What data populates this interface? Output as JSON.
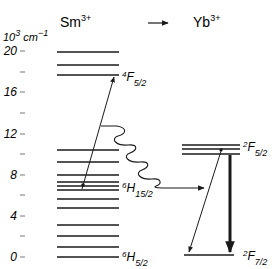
{
  "axis": {
    "unit_base": "10",
    "unit_exp": "3",
    "unit_rest": " cm",
    "unit_exp2": "−1",
    "ticks": [
      {
        "value": 20,
        "label": "20",
        "y": 51
      },
      {
        "value": 18,
        "label": "",
        "y": 72
      },
      {
        "value": 16,
        "label": "16",
        "y": 92
      },
      {
        "value": 14,
        "label": "",
        "y": 113
      },
      {
        "value": 12,
        "label": "12",
        "y": 134
      },
      {
        "value": 10,
        "label": "",
        "y": 154
      },
      {
        "value": 8,
        "label": "8",
        "y": 175
      },
      {
        "value": 6,
        "label": "",
        "y": 195
      },
      {
        "value": 4,
        "label": "4",
        "y": 216
      },
      {
        "value": 2,
        "label": "",
        "y": 236
      },
      {
        "value": 0,
        "label": "0",
        "y": 257
      }
    ]
  },
  "header": {
    "donor_base": "Sm",
    "donor_charge": "3+",
    "transfer_arrow": "→",
    "acceptor_base": "Yb",
    "acceptor_charge": "3+"
  },
  "sm_levels_y": [
    52,
    65,
    75,
    150,
    162,
    175,
    182,
    186,
    190,
    199,
    208,
    225,
    236,
    247,
    257
  ],
  "yb_levels_y": [
    145,
    149,
    154
  ],
  "yb_ground_y": 255,
  "terms": {
    "sm_4F52": {
      "mult": "4",
      "letter": "F",
      "j": "5/2"
    },
    "sm_6H152": {
      "mult": "6",
      "letter": "H",
      "j": "15/2"
    },
    "sm_6H52": {
      "mult": "6",
      "letter": "H",
      "j": "5/2"
    },
    "yb_2F52": {
      "mult": "2",
      "letter": "F",
      "j": "5/2"
    },
    "yb_2F72": {
      "mult": "2",
      "letter": "F",
      "j": "7/2"
    }
  },
  "chart_data": {
    "type": "energy-level-diagram",
    "ylabel": "10^3 cm^-1",
    "ylim": [
      0,
      20
    ],
    "yticks": [
      0,
      4,
      8,
      12,
      16,
      20
    ],
    "columns": [
      {
        "ion": "Sm3+",
        "levels_1e3cm": [
          20.2,
          18.9,
          17.9,
          10.5,
          9.3,
          8.0,
          7.3,
          6.9,
          6.5,
          5.6,
          4.8,
          3.1,
          2.0,
          1.0,
          0.0
        ],
        "terms": [
          {
            "label": "4F5/2",
            "energy": 17.9
          },
          {
            "label": "6H15/2",
            "energy": 6.9
          },
          {
            "label": "6H5/2",
            "energy": 0
          }
        ]
      },
      {
        "ion": "Yb3+",
        "levels_1e3cm": [
          10.9,
          10.5,
          10.1,
          0.2
        ],
        "terms": [
          {
            "label": "2F5/2",
            "energy": 10.5
          },
          {
            "label": "2F7/2",
            "energy": 0
          }
        ]
      }
    ],
    "transitions": [
      {
        "kind": "excitation",
        "from": "Sm 6H15/2 (~6.8)",
        "to": "Sm 4F5/2 (~17.9)",
        "style": "thin arrow up"
      },
      {
        "kind": "energy-transfer",
        "from": "Sm (~12.5)",
        "to": "Yb (~6.7)",
        "style": "wavy arrow"
      },
      {
        "kind": "emission",
        "from": "Yb 2F5/2",
        "to": "Yb 2F7/2",
        "style": "thick arrow down"
      },
      {
        "kind": "emission",
        "from": "Yb 2F5/2 (~10.8)",
        "to": "Yb 2F7/2 (~0.2)",
        "style": "thin arrow down-left"
      }
    ]
  }
}
